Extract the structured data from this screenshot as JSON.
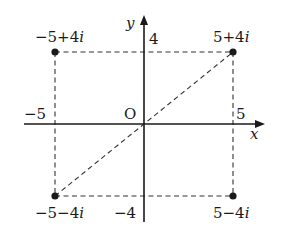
{
  "diagram": {
    "type": "complex-plane",
    "axes": {
      "x_label": "x",
      "y_label": "y",
      "origin_label": "O",
      "ticks": {
        "x_neg": "−5",
        "x_pos": "5",
        "y_pos": "4",
        "y_neg": "−4"
      }
    },
    "points": [
      {
        "id": "top-left",
        "label": "−5+4i",
        "re": -5,
        "im": 4
      },
      {
        "id": "top-right",
        "label": "5+4i",
        "re": 5,
        "im": 4
      },
      {
        "id": "bottom-left",
        "label": "−5−4i",
        "re": -5,
        "im": -4
      },
      {
        "id": "bottom-right",
        "label": "5−4i",
        "re": 5,
        "im": -4
      }
    ],
    "segments": [
      {
        "from": "bottom-left",
        "to": "top-right",
        "style": "dashed"
      }
    ],
    "rectangle": {
      "style": "dashed",
      "corners": [
        "top-left",
        "top-right",
        "bottom-right",
        "bottom-left"
      ]
    },
    "colors": {
      "ink": "#1a1a1a",
      "background": "#ffffff"
    }
  }
}
